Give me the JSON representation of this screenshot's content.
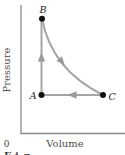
{
  "diagram": {
    "type": "pressure-volume-cycle",
    "axes": {
      "ylabel": "Pressure",
      "xlabel": "Volume",
      "origin_label": "0"
    },
    "points": [
      {
        "label": "A",
        "position": "bottom-left vertex of cycle"
      },
      {
        "label": "B",
        "position": "top vertex of cycle"
      },
      {
        "label": "C",
        "position": "bottom-right vertex of cycle"
      }
    ],
    "edges": [
      {
        "from": "A",
        "to": "B",
        "shape": "vertical-line",
        "arrow_direction": "up"
      },
      {
        "from": "B",
        "to": "C",
        "shape": "concave-curve",
        "arrow_direction": "down-right"
      },
      {
        "from": "C",
        "to": "A",
        "shape": "horizontal-line",
        "arrow_direction": "left"
      }
    ],
    "caption_fragment": "Fig.",
    "colors": {
      "cycle_line": "#a5a5a5",
      "arrowhead": "#9a9a9a",
      "axis_line": "#8c8c8c",
      "point_dot": "#111111",
      "axis_text": "#4f4f48",
      "point_text": "#1c1c1c"
    }
  }
}
